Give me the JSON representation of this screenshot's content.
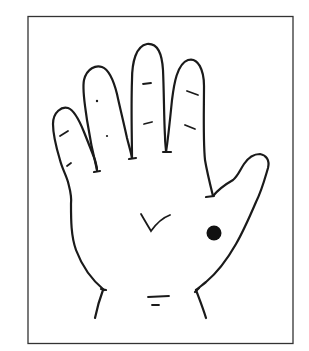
{
  "figure": {
    "description": "Line drawing of an open right-hand palm with a black dot marking a point on the palm near the base of the thumb",
    "marker": {
      "shape": "filled-circle",
      "color": "#111111",
      "location": "thenar region below index finger, near thumb"
    },
    "colors": {
      "background": "#ffffff",
      "stroke": "#1a1a1a",
      "frame": "#333333"
    }
  }
}
